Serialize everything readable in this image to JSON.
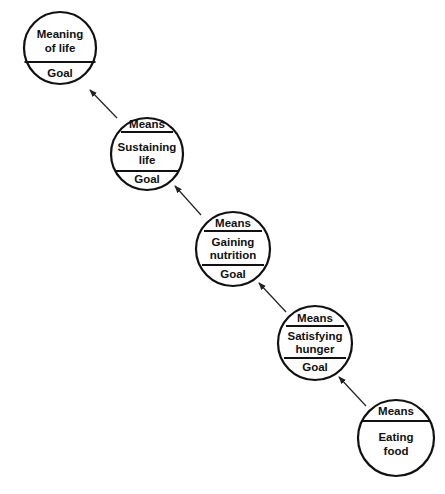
{
  "diagram": {
    "nodes": [
      {
        "id": "meaning-of-life",
        "center_label": [
          "Meaning",
          "of life"
        ],
        "top_label": null,
        "bottom_label": "Goal",
        "cx": 60,
        "cy": 48,
        "r": 36,
        "sections": "label-over-goal"
      },
      {
        "id": "sustaining-life",
        "top_label": "Means",
        "center_label": [
          "Sustaining",
          "life"
        ],
        "bottom_label": "Goal",
        "cx": 147,
        "cy": 154,
        "r": 36
      },
      {
        "id": "gaining-nutrition",
        "top_label": "Means",
        "center_label": [
          "Gaining",
          "nutrition"
        ],
        "bottom_label": "Goal",
        "cx": 233,
        "cy": 249,
        "r": 37
      },
      {
        "id": "satisfying-hunger",
        "top_label": "Means",
        "center_label": [
          "Satisfying",
          "hunger"
        ],
        "bottom_label": "Goal",
        "cx": 315,
        "cy": 343,
        "r": 37
      },
      {
        "id": "eating-food",
        "top_label": "Means",
        "center_label": [
          "Eating",
          "food"
        ],
        "bottom_label": null,
        "cx": 396,
        "cy": 438,
        "r": 38,
        "sections": "means-over-label"
      }
    ],
    "edges": [
      {
        "from": "sustaining-life",
        "to": "meaning-of-life"
      },
      {
        "from": "gaining-nutrition",
        "to": "sustaining-life"
      },
      {
        "from": "satisfying-hunger",
        "to": "gaining-nutrition"
      },
      {
        "from": "eating-food",
        "to": "satisfying-hunger"
      }
    ]
  },
  "labels": {
    "n1_line1": "Meaning",
    "n1_line2": "of life",
    "n1_goal": "Goal",
    "n2_means": "Means",
    "n2_line1": "Sustaining",
    "n2_line2": "life",
    "n2_goal": "Goal",
    "n3_means": "Means",
    "n3_line1": "Gaining",
    "n3_line2": "nutrition",
    "n3_goal": "Goal",
    "n4_means": "Means",
    "n4_line1": "Satisfying",
    "n4_line2": "hunger",
    "n4_goal": "Goal",
    "n5_means": "Means",
    "n5_line1": "Eating",
    "n5_line2": "food"
  },
  "colors": {
    "stroke": "#111111",
    "background": "#ffffff"
  }
}
